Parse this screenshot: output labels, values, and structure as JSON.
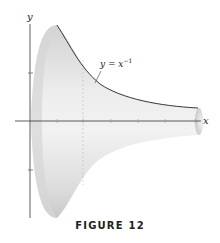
{
  "figure": {
    "caption": "FIGURE 12",
    "curve_label_base": "y = x",
    "curve_label_exp": "−1",
    "x_axis_label": "x",
    "y_axis_label": "y"
  },
  "colors": {
    "surface_light": "#f0f0f0",
    "surface_dark": "#c9c9c9",
    "curve": "#3a3a3a",
    "axis": "#333333"
  }
}
